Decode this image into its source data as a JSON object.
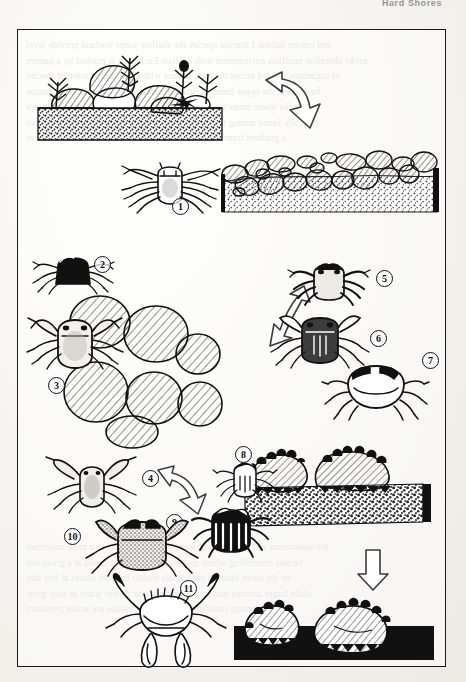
{
  "page": {
    "running_head": "Hard Shores",
    "bleed_lines": [
      "and  colony  habitat  Littorina  species  the  shallow  water  lowland  provide  level",
      "rocky  shoreline  mudflats  environment  with  habitats  Each  zone  is  marked  by  a  pattern",
      "of  organisms  banded  across  the  rock  surface  with  a  few  highly  tolerant  species",
      "found  near  the  upper  limits  of  tidal  influence  and  far  more  diverse  groups",
      "in  the  lower  zones  where  immersion  times  are  longer  Many  crabs  are",
      "typically  found  among  the  cobble  and  boulder  fields  shown  in  the  figures",
      "a  gradient  from  coarse  gravel  through  cobble  to  bedrock  surfaces"
    ],
    "bleed_lines_lower": [
      "the  substratum  and  the  degree  of  wave  exposure  are  the  two  most  important",
      "factors  controlling  which  species  of  crab  will  be  found  at  a  given  site",
      "on  the  shore  Smaller  individuals  shelter  beneath  stones  at  low  tide",
      "while  larger  animals  may  move  offshore  into  deeper  water  as  they  grow",
      "the  swimming  crabs  of  the  family  Portunidae  are  active  predators"
    ]
  },
  "figure": {
    "panels": [
      {
        "name": "boulder-shore-habitat",
        "caption": ""
      },
      {
        "name": "cobble-field-habitat",
        "caption": ""
      },
      {
        "name": "boulder-pile-habitat",
        "caption": ""
      },
      {
        "name": "barnacle-rock-gravel-habitat",
        "caption": ""
      },
      {
        "name": "rocks-on-black-substrate",
        "caption": ""
      }
    ],
    "arrows": [
      {
        "name": "arrow-boulder-to-cobble",
        "direction": "down-right"
      },
      {
        "name": "arrow-cobble-to-boulders",
        "direction": "down-left"
      },
      {
        "name": "arrow-to-crab-nine",
        "direction": "down-right"
      },
      {
        "name": "arrow-down-to-black-panel",
        "direction": "down"
      }
    ],
    "callouts": [
      {
        "id": "1",
        "label": "1"
      },
      {
        "id": "2",
        "label": "2"
      },
      {
        "id": "3",
        "label": "3"
      },
      {
        "id": "4",
        "label": "4"
      },
      {
        "id": "5",
        "label": "5"
      },
      {
        "id": "6",
        "label": "6"
      },
      {
        "id": "7",
        "label": "7"
      },
      {
        "id": "8",
        "label": "8"
      },
      {
        "id": "9",
        "label": "9"
      },
      {
        "id": "10",
        "label": "10"
      },
      {
        "id": "11",
        "label": "11"
      }
    ]
  },
  "colors": {
    "ink": "#111111",
    "paper": "#f4f3ef",
    "bleed_text": "#cfccc4",
    "hatch": "#4a4a4a"
  }
}
